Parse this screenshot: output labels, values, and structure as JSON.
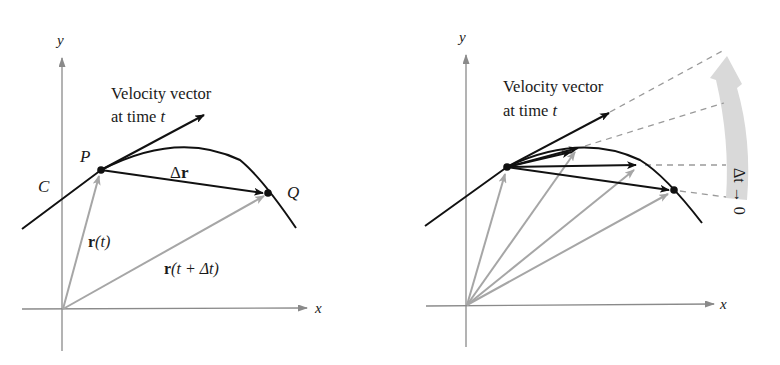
{
  "colors": {
    "curve": "#111111",
    "axis": "#8a8a8a",
    "position_vector": "#a6a6a6",
    "delta_vector": "#111111",
    "dashed": "#9a9a9a",
    "limit_arrow": "#d9d9d9",
    "text": "#1a1a1a"
  },
  "left_panel": {
    "axis_x_label": "x",
    "axis_y_label": "y",
    "curve_label": "C",
    "point_p_label": "P",
    "point_q_label": "Q",
    "velocity_label_line1": "Velocity vector",
    "velocity_label_line2_prefix": "at time ",
    "velocity_label_line2_var": "t",
    "delta_r_prefix": "Δ",
    "delta_r_var": "r",
    "r_t_bold": "r",
    "r_t_args": "(t)",
    "r_t_dt_bold": "r",
    "r_t_dt_args": "(t + Δt)"
  },
  "right_panel": {
    "axis_x_label": "x",
    "axis_y_label": "y",
    "velocity_label_line1": "Velocity vector",
    "velocity_label_line2_prefix": "at time ",
    "velocity_label_line2_var": "t",
    "limit_label": "Δt → 0"
  }
}
